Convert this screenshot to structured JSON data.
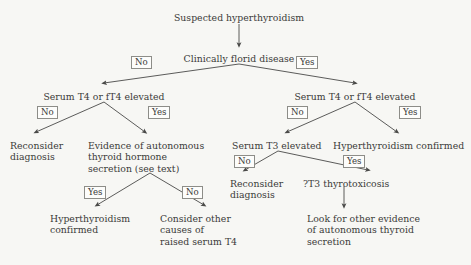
{
  "diagram": {
    "title": "Suspected hyperthyroidism",
    "type": "clinical-decision-tree",
    "background_color": "#f7f7f4",
    "text_color": "#3a3a38",
    "line_color": "#4a4a48"
  },
  "nodes": [
    {
      "id": "root",
      "label": "Suspected hyperthyroidism",
      "lines": [
        "Suspected hyperthyroidism"
      ],
      "x": 239,
      "y": 12,
      "align": "centered",
      "kind": "start"
    },
    {
      "id": "florid",
      "label": "Clinically florid disease",
      "lines": [
        "Clinically florid disease"
      ],
      "x": 239,
      "y": 53,
      "align": "centered",
      "kind": "decision"
    },
    {
      "id": "t4-left",
      "label": "Serum T4 or fT4 elevated",
      "lines": [
        "Serum T4 or fT4 elevated"
      ],
      "x": 104,
      "y": 91,
      "align": "centered",
      "kind": "decision"
    },
    {
      "id": "t4-right",
      "label": "Serum T4 or fT4 elevated",
      "lines": [
        "Serum T4 or fT4 elevated"
      ],
      "x": 355,
      "y": 91,
      "align": "centered",
      "kind": "decision"
    },
    {
      "id": "reconsider-left",
      "label": "Reconsider diagnosis",
      "lines": [
        "Reconsider",
        "diagnosis"
      ],
      "x": 10,
      "y": 140,
      "align": "left",
      "kind": "outcome"
    },
    {
      "id": "evidence-autonomous",
      "label": "Evidence of autonomous thyroid hormone secretion (see text)",
      "lines": [
        "Evidence of autonomous",
        "thyroid hormone",
        "secretion (see text)"
      ],
      "x": 88,
      "y": 140,
      "align": "left",
      "kind": "decision"
    },
    {
      "id": "t3-elevated",
      "label": "Serum T3 elevated",
      "lines": [
        "Serum T3 elevated"
      ],
      "x": 232,
      "y": 140,
      "align": "left",
      "kind": "decision"
    },
    {
      "id": "hyper-confirmed-right",
      "label": "Hyperthyroidism confirmed",
      "lines": [
        "Hyperthyroidism confirmed"
      ],
      "x": 333,
      "y": 140,
      "align": "left",
      "kind": "outcome"
    },
    {
      "id": "reconsider-right",
      "label": "Reconsider diagnosis",
      "lines": [
        "Reconsider",
        "diagnosis"
      ],
      "x": 230,
      "y": 178,
      "align": "left",
      "kind": "outcome"
    },
    {
      "id": "t3-thyrotoxicosis",
      "label": "?T3 thyrotoxicosis",
      "lines": [
        "?T3 thyrotoxicosis"
      ],
      "x": 303,
      "y": 178,
      "align": "left",
      "kind": "outcome"
    },
    {
      "id": "hyper-confirmed-left",
      "label": "Hyperthyroidism confirmed",
      "lines": [
        "Hyperthyroidism",
        "confirmed"
      ],
      "x": 50,
      "y": 213,
      "align": "left",
      "kind": "outcome"
    },
    {
      "id": "consider-other",
      "label": "Consider other causes of raised serum T4",
      "lines": [
        "Consider other",
        "causes of",
        "raised serum T4"
      ],
      "x": 160,
      "y": 213,
      "align": "left",
      "kind": "outcome"
    },
    {
      "id": "look-for-evidence",
      "label": "Look for other evidence of autonomous thyroid secretion",
      "lines": [
        "Look for other evidence",
        "of autonomous thyroid",
        "secretion"
      ],
      "x": 307,
      "y": 213,
      "align": "left",
      "kind": "outcome"
    }
  ],
  "branch_labels": [
    {
      "id": "florid-no",
      "text": "No",
      "x": 131,
      "y": 56
    },
    {
      "id": "florid-yes",
      "text": "Yes",
      "x": 296,
      "y": 56
    },
    {
      "id": "t4left-no",
      "text": "No",
      "x": 37,
      "y": 106
    },
    {
      "id": "t4left-yes",
      "text": "Yes",
      "x": 148,
      "y": 106
    },
    {
      "id": "t4right-no",
      "text": "No",
      "x": 287,
      "y": 106
    },
    {
      "id": "t4right-yes",
      "text": "Yes",
      "x": 399,
      "y": 106
    },
    {
      "id": "t3-no",
      "text": "No",
      "x": 234,
      "y": 155
    },
    {
      "id": "t3-yes",
      "text": "Yes",
      "x": 343,
      "y": 155
    },
    {
      "id": "evidence-yes",
      "text": "Yes",
      "x": 84,
      "y": 186
    },
    {
      "id": "evidence-no",
      "text": "No",
      "x": 182,
      "y": 186
    }
  ],
  "connectors": [
    {
      "id": "root-to-florid",
      "from": "root",
      "to": "florid",
      "path": "M 239,24 L 239,45",
      "arrow": true
    },
    {
      "id": "florid-to-t4left",
      "from": "florid",
      "to": "t4-left",
      "path": "M 239,64 L 104,83",
      "arrow": true
    },
    {
      "id": "florid-to-t4right",
      "from": "florid",
      "to": "t4-right",
      "path": "M 239,64 L 355,83",
      "arrow": true
    },
    {
      "id": "t4left-to-reconsider",
      "from": "t4-left",
      "to": "reconsider-left",
      "path": "M 104,102 L 36,132",
      "arrow": true
    },
    {
      "id": "t4left-to-evidence",
      "from": "t4-left",
      "to": "evidence-autonomous",
      "path": "M 104,102 L 145,132",
      "arrow": true
    },
    {
      "id": "t4right-to-t3",
      "from": "t4-right",
      "to": "t3-elevated",
      "path": "M 355,102 L 287,132",
      "arrow": true
    },
    {
      "id": "t4right-to-confirmed",
      "from": "t4-right",
      "to": "hyper-confirmed-right",
      "path": "M 355,102 L 397,132",
      "arrow": true
    },
    {
      "id": "t3-to-reconsider",
      "from": "t3-elevated",
      "to": "reconsider-right",
      "path": "M 278,151 L 245,170",
      "arrow": true
    },
    {
      "id": "t3-to-thyrotoxicosis",
      "from": "t3-elevated",
      "to": "t3-thyrotoxicosis",
      "path": "M 278,151 L 368,170",
      "arrow": true
    },
    {
      "id": "evidence-to-confirmed",
      "from": "evidence-autonomous",
      "to": "hyper-confirmed-left",
      "path": "M 150,173 L 97,205",
      "arrow": true
    },
    {
      "id": "evidence-to-consider",
      "from": "evidence-autonomous",
      "to": "consider-other",
      "path": "M 150,173 L 204,205",
      "arrow": true
    },
    {
      "id": "thyrotox-to-look",
      "from": "t3-thyrotoxicosis",
      "to": "look-for-evidence",
      "path": "M 344,186 L 344,206",
      "arrow": true
    }
  ]
}
